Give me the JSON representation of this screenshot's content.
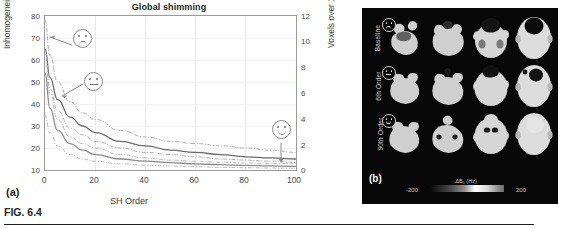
{
  "figure": {
    "caption": "FIG. 6.4"
  },
  "panel_a": {
    "letter": "(a)",
    "title": "Global shimming",
    "ylabel_left": "Inhomogeneity (Hz)",
    "ylabel_right": "Voxels over 100 Hz (%)",
    "xlabel": "SH Order",
    "yticks_left": [
      "80",
      "70",
      "60",
      "50",
      "40",
      "30",
      "20",
      "10"
    ],
    "yticks_right": [
      "12",
      "10",
      "8",
      "6",
      "4",
      "2",
      "0"
    ],
    "xticks": [
      "0",
      "20",
      "40",
      "60",
      "80",
      "100"
    ],
    "annotations": [
      {
        "name": "sad-face",
        "mood": "sad"
      },
      {
        "name": "neutral-face",
        "mood": "neutral"
      },
      {
        "name": "happy-face",
        "mood": "happy"
      }
    ]
  },
  "panel_b": {
    "letter": "(b)",
    "rows": [
      {
        "label": "Baseline",
        "mood": "sad"
      },
      {
        "label": "6th Order",
        "mood": "neutral"
      },
      {
        "label": "90th Order",
        "mood": "happy"
      }
    ],
    "colorbar": {
      "title": "ΔB₀ (Hz)",
      "min": "-200",
      "max": "200"
    }
  },
  "chart_data": {
    "type": "line",
    "title": "Global shimming",
    "xlabel": "SH Order",
    "ylabel": "Inhomogeneity (Hz)",
    "ylabel_secondary": "Voxels over 100 Hz (%)",
    "xlim": [
      0,
      100
    ],
    "ylim": [
      10,
      80
    ],
    "ylim_secondary": [
      0,
      12
    ],
    "grid": true,
    "legend": "none",
    "x": [
      0,
      2,
      5,
      10,
      15,
      20,
      30,
      40,
      50,
      60,
      70,
      80,
      90,
      100
    ],
    "series": [
      {
        "name": "Inhomogeneity mean (upper)",
        "style": "solid",
        "color": "#6a6a6a",
        "values": [
          65,
          52,
          42,
          34,
          30,
          27,
          23,
          21,
          19,
          18,
          17,
          16,
          15.5,
          15
        ]
      },
      {
        "name": "Inhomogeneity upper CI",
        "style": "dash-dot",
        "color": "#9a9a9a",
        "values": [
          78,
          62,
          50,
          41,
          36,
          33,
          28,
          25,
          23,
          22,
          21,
          20,
          19,
          18
        ]
      },
      {
        "name": "Inhomogeneity lower CI",
        "style": "dash-dot",
        "color": "#9a9a9a",
        "values": [
          65,
          47,
          37,
          29,
          26,
          23,
          20,
          18,
          17,
          16,
          15,
          14.5,
          14,
          13.5
        ]
      },
      {
        "name": "Voxels over 100 Hz mean (lower)",
        "style": "solid",
        "color": "#8a8a8a",
        "values": [
          54,
          38,
          28,
          22,
          19,
          17,
          15,
          14,
          13.3,
          12.8,
          12.4,
          12.1,
          11.9,
          11.7
        ]
      },
      {
        "name": "Voxels upper CI",
        "style": "dash-dot",
        "color": "#a8a8a8",
        "values": [
          65,
          45,
          33,
          25,
          22,
          20,
          17,
          15.5,
          14.5,
          14,
          13.5,
          13.2,
          13,
          12.8
        ]
      },
      {
        "name": "Voxels lower CI",
        "style": "dash-dot",
        "color": "#a8a8a8",
        "values": [
          35,
          27,
          21,
          17,
          15,
          14,
          12.8,
          12.2,
          11.8,
          11.5,
          11.2,
          11.05,
          10.9,
          10.8
        ]
      }
    ],
    "annotations": [
      {
        "text": "sad-face",
        "x": 15,
        "y": 68
      },
      {
        "text": "neutral-face",
        "x": 20,
        "y": 51
      },
      {
        "text": "happy-face",
        "x": 90,
        "y": 20
      }
    ]
  }
}
